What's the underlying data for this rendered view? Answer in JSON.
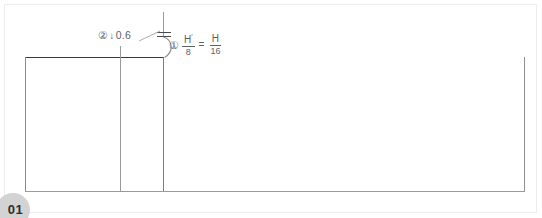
{
  "page": {
    "badge_label": "01",
    "width": 542,
    "height": 218,
    "background_color": "#ffffff",
    "border_color": "#ededed"
  },
  "drawing": {
    "title": "",
    "line_color_primary": "#3a3a3a",
    "line_color_secondary": "#8a8a8a",
    "line_color_light": "#b5b5b5",
    "annotation_color": "#5a5f63",
    "geometry": {
      "top_edge_y": 57,
      "bottom_edge_y": 192,
      "left_edge_x": 25,
      "right_edge_x": 525,
      "inner_vertical_1_x": 120,
      "inner_vertical_2_x": 163,
      "vertical_extension_top_y": 12,
      "tick_mark_y_upper": 33,
      "tick_mark_y_lower": 37,
      "arc_start_y": 37,
      "arc_end_y": 57,
      "arc_bulge_x": 172
    }
  },
  "annotations": {
    "ratio": {
      "marker": "①",
      "numerator_left": "H",
      "prime": "′",
      "denominator_left": "8",
      "equals": "=",
      "numerator_right": "H",
      "denominator_right": "16",
      "full_text": "① H′/8 = H/16"
    },
    "depth": {
      "marker": "②",
      "arrow": "↓",
      "value": "0.6",
      "full_text": "② ↓ 0.6"
    }
  }
}
